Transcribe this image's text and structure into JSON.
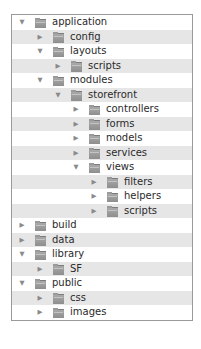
{
  "tree": {
    "rows": [
      {
        "label": "application",
        "depth": 0,
        "expanded": true
      },
      {
        "label": "config",
        "depth": 1,
        "expanded": false
      },
      {
        "label": "layouts",
        "depth": 1,
        "expanded": true
      },
      {
        "label": "scripts",
        "depth": 2,
        "expanded": false
      },
      {
        "label": "modules",
        "depth": 1,
        "expanded": true
      },
      {
        "label": "storefront",
        "depth": 2,
        "expanded": true
      },
      {
        "label": "controllers",
        "depth": 3,
        "expanded": false
      },
      {
        "label": "forms",
        "depth": 3,
        "expanded": false
      },
      {
        "label": "models",
        "depth": 3,
        "expanded": false
      },
      {
        "label": "services",
        "depth": 3,
        "expanded": false
      },
      {
        "label": "views",
        "depth": 3,
        "expanded": true
      },
      {
        "label": "filters",
        "depth": 4,
        "expanded": false
      },
      {
        "label": "helpers",
        "depth": 4,
        "expanded": false
      },
      {
        "label": "scripts",
        "depth": 4,
        "expanded": false
      },
      {
        "label": "build",
        "depth": 0,
        "expanded": false
      },
      {
        "label": "data",
        "depth": 0,
        "expanded": false
      },
      {
        "label": "library",
        "depth": 0,
        "expanded": true
      },
      {
        "label": "SF",
        "depth": 1,
        "expanded": false
      },
      {
        "label": "public",
        "depth": 0,
        "expanded": true
      },
      {
        "label": "css",
        "depth": 1,
        "expanded": false
      },
      {
        "label": "images",
        "depth": 1,
        "expanded": false
      },
      {
        "label": "tests",
        "depth": 0,
        "expanded": false
      }
    ],
    "icons": {
      "expanded": "▼",
      "collapsed": "▶",
      "folder": "folder-icon"
    },
    "colors": {
      "stripe": "#e6e6e6",
      "border": "#9a9a9a",
      "text": "#2a2a2a",
      "icon": "#8e8e8e"
    }
  }
}
